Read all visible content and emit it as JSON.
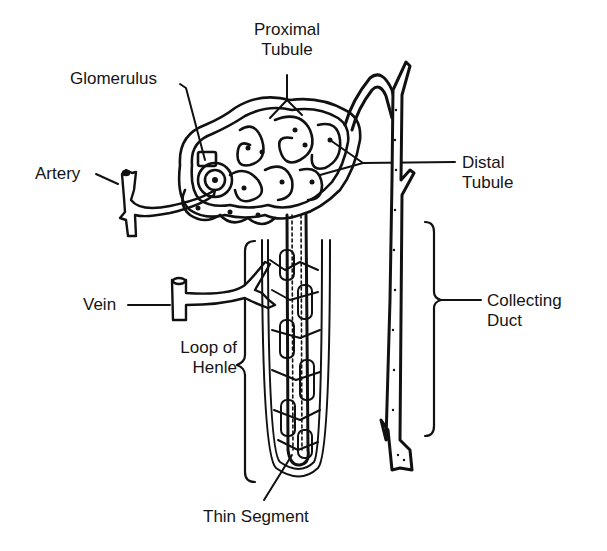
{
  "labels": {
    "proximal_tubule": [
      "Proximal",
      "Tubule"
    ],
    "glomerulus": "Glomerulus",
    "artery": "Artery",
    "distal_tubule": [
      "Distal",
      "Tubule"
    ],
    "vein": "Vein",
    "loop_of_henle": [
      "Loop of",
      "Henle"
    ],
    "collecting_duct": [
      "Collecting",
      "Duct"
    ],
    "thin_segment": "Thin Segment"
  },
  "colors": {
    "ink": "#111111",
    "background": "#ffffff"
  }
}
